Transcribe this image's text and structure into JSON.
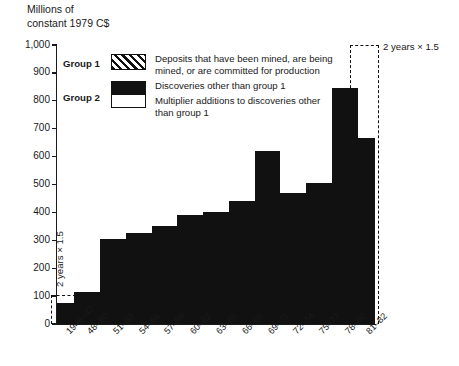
{
  "axis_title": "Millions of\nconstant 1979 C$",
  "legend": {
    "group1_label": "Group 1",
    "group2_label": "Group 2",
    "group1_text": "Deposits that have been mined, are being\nmined, or are committed for production",
    "group2_text_a": "Discoveries other than group 1",
    "group2_text_b": "Multiplier additions to discoveries other\nthan group 1"
  },
  "annotations": {
    "left_note": "2 years  ×  1.5",
    "right_note": "2 years  ×  1.5"
  },
  "chart_data": {
    "type": "bar",
    "title": "",
    "subtitle": "",
    "xlabel": "",
    "ylabel": "Millions of constant 1979 C$",
    "ylim": [
      0,
      1000
    ],
    "ytick_step": 100,
    "ytick_labels": [
      "0",
      "100",
      "200",
      "300",
      "400",
      "500",
      "600",
      "700",
      "800",
      "900",
      "1,000"
    ],
    "ytick_values": [
      0,
      100,
      200,
      300,
      400,
      500,
      600,
      700,
      800,
      900,
      1000
    ],
    "grid": false,
    "legend_position": "inside-top-left",
    "bar_color": "#111111",
    "categories": [
      "1946–47",
      "48–50",
      "51–53",
      "54–56",
      "57–59",
      "60–62",
      "63–65",
      "66–68",
      "69–71",
      "72–74",
      "75–77",
      "78–80",
      "81–82"
    ],
    "values": [
      75,
      115,
      305,
      325,
      350,
      390,
      400,
      440,
      620,
      470,
      505,
      845,
      665
    ],
    "bar_widths_years": [
      2,
      3,
      3,
      3,
      3,
      3,
      3,
      3,
      3,
      3,
      3,
      3,
      2
    ],
    "annotation_notes": [
      {
        "category": "1946–47",
        "text": "2 years  ×  1.5"
      },
      {
        "category": "81–82",
        "text": "2 years  ×  1.5"
      }
    ],
    "series": [
      {
        "name": "Group 2 — Discoveries other than group 1 (plus multiplier additions)",
        "values": [
          75,
          115,
          305,
          325,
          350,
          390,
          400,
          440,
          620,
          470,
          505,
          845,
          665
        ]
      }
    ]
  }
}
